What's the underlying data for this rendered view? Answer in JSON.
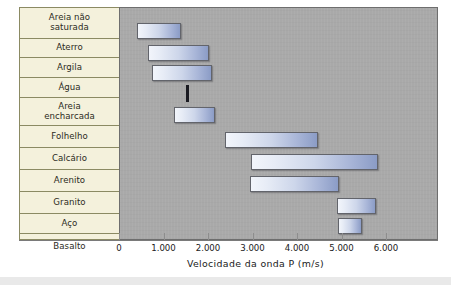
{
  "chart_data": {
    "type": "bar",
    "orientation": "horizontal",
    "subtype": "range-bar",
    "title": "",
    "xlabel": "Velocidade da onda P (m/s)",
    "ylabel": "",
    "xlim": [
      0,
      7150
    ],
    "xticks": [
      0,
      1000,
      2000,
      3000,
      4000,
      5000,
      6000
    ],
    "xticklabels": [
      "0",
      "1.000",
      "2.000",
      "3.000",
      "4.000",
      "5.000",
      "6.000"
    ],
    "grid": false,
    "legend": null,
    "categories": [
      "Areia não saturada",
      "Aterro",
      "Argila",
      "Água",
      "Areia encharcada",
      "Folhelho",
      "Calcário",
      "Arenito",
      "Granito",
      "Aço",
      "Basalto"
    ],
    "ranges": [
      {
        "category": "Areia não saturada",
        "min": 380,
        "max": 1370
      },
      {
        "category": "Aterro",
        "min": 620,
        "max": 2000
      },
      {
        "category": "Argila",
        "min": 720,
        "max": 2070
      },
      {
        "category": "Água",
        "min": 1490,
        "max": 1560
      },
      {
        "category": "Areia encharcada",
        "min": 1210,
        "max": 2130
      },
      {
        "category": "Folhelho",
        "min": 2360,
        "max": 4450
      },
      {
        "category": "Calcário",
        "min": 2950,
        "max": 5800
      },
      {
        "category": "Arenito",
        "min": 2920,
        "max": 4920
      },
      {
        "category": "Granito",
        "min": 4870,
        "max": 5750
      },
      {
        "category": "Aço",
        "min": 4900,
        "max": 5440
      },
      {
        "category": "Basalto",
        "min": 5400,
        "max": 6390
      }
    ],
    "colors": {
      "plot_background": "#a9a9a9",
      "label_background": "#f4f1dc",
      "label_border": "#8b8a63",
      "bar_gradient_start": "#f2f5fb",
      "bar_gradient_end": "#8b9cc6",
      "bar_border": "#62646b",
      "water_marker": "#1b1b22",
      "axis": "#7a7a7a",
      "text": "#20201a"
    }
  },
  "labels": {
    "row_0_line_1": "Areia não",
    "row_0_line_2": "saturada",
    "row_1": "Aterro",
    "row_2": "Argila",
    "row_3": "Água",
    "row_4_line_1": "Areia",
    "row_4_line_2": "encharcada",
    "row_5": "Folhelho",
    "row_6": "Calcário",
    "row_7": "Arenito",
    "row_8": "Granito",
    "row_9": "Aço",
    "row_10": "Basalto"
  },
  "axis": {
    "title": "Velocidade da onda P (m/s)",
    "tick_0": "0",
    "tick_1": "1.000",
    "tick_2": "2.000",
    "tick_3": "3.000",
    "tick_4": "4.000",
    "tick_5": "5.000",
    "tick_6": "6.000"
  }
}
